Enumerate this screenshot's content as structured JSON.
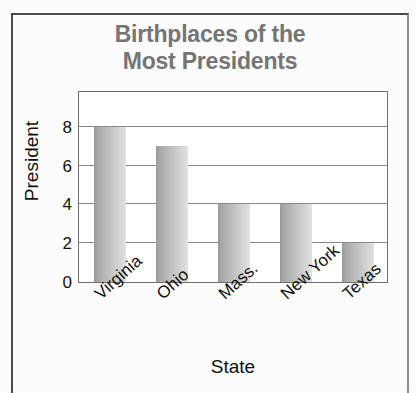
{
  "chart_data": {
    "type": "bar",
    "title": "Birthplaces of the Most Presidents",
    "title_lines": [
      "Birthplaces of the",
      "Most Presidents"
    ],
    "categories": [
      "Virginia",
      "Ohio",
      "Mass.",
      "New York",
      "Texas"
    ],
    "values": [
      8,
      7,
      4,
      4,
      2
    ],
    "xlabel": "State",
    "ylabel": "President",
    "ylim": [
      0,
      9.9
    ],
    "yticks": [
      0,
      2,
      4,
      6,
      8
    ],
    "ytick_labels": [
      "0",
      "2",
      "4",
      "6",
      "8"
    ],
    "grid": true,
    "legend": "none",
    "bar_color_dark": "#9a9a9a",
    "bar_color_light": "#e2e2e2",
    "title_color": "#757575",
    "axis_text_color": "#111111",
    "gridline_color": "#8a8a8a",
    "plot_background": "#ffffff",
    "frame_color": "#4a4a4a"
  }
}
